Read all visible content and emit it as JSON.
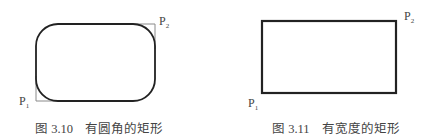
{
  "figures": [
    {
      "id": "fig-3-10",
      "caption_number": "图 3.10",
      "caption_text": "有圆角的矩形",
      "shape": "rounded-rectangle",
      "point_p1": {
        "label": "P",
        "sub": "1"
      },
      "point_p2": {
        "label": "P",
        "sub": "2"
      },
      "stroke_color": "#222222",
      "guide_color": "#8a8a8a"
    },
    {
      "id": "fig-3-11",
      "caption_number": "图 3.11",
      "caption_text": "有宽度的矩形",
      "shape": "thick-border-rectangle",
      "point_p1": {
        "label": "P",
        "sub": "1"
      },
      "point_p2": {
        "label": "P",
        "sub": "2"
      },
      "stroke_color": "#222222"
    }
  ]
}
